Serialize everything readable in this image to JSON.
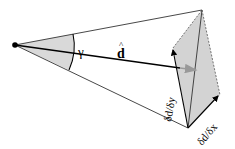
{
  "diagram": {
    "type": "geometric-vector-diagram",
    "colors": {
      "stroke": "#222222",
      "cone_fill": "#d9d9d9",
      "quad_fill": "#d3d3d3",
      "arrow_tip_gray": "#999999"
    },
    "labels": {
      "angle": "γ",
      "direction_vector": "d",
      "direction_hat": "^",
      "partial_y": "δd/δy",
      "partial_x": "δd/δx"
    }
  }
}
